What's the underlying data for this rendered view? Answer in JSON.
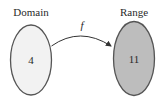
{
  "diagram": {
    "domain": {
      "title": "Domain",
      "value": "4",
      "fill": "#f2f2f2",
      "stroke": "#555555"
    },
    "range": {
      "title": "Range",
      "value": "11",
      "fill": "#bdbdbd",
      "stroke": "#555555"
    },
    "mapping": {
      "label": "f",
      "from": "domain",
      "to": "range"
    }
  }
}
